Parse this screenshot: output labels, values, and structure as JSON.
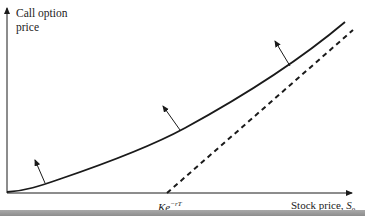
{
  "diagram": {
    "y_axis_label_line1": "Call option",
    "y_axis_label_line2": "price",
    "x_axis_label": "Stock price, ",
    "x_axis_symbol": "S",
    "x_axis_subscript": "0",
    "lower_bound_label_base": "Ke",
    "lower_bound_label_exp": "−rT",
    "curves": [
      {
        "name": "call-option-price",
        "style": "solid"
      },
      {
        "name": "lower-bound S0 - Ke^{-rT}",
        "style": "dashed",
        "starts_at": "Ke^{-rT}"
      }
    ],
    "arrows": 3,
    "colors": {
      "line": "#1a1a1a",
      "footer_bar": "#9a9a9a"
    }
  }
}
